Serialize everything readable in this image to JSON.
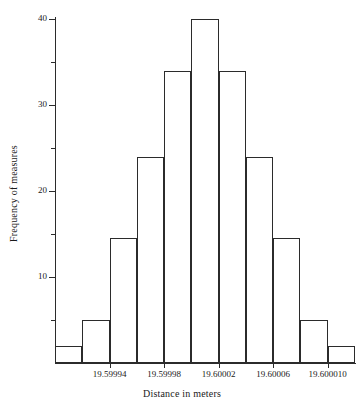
{
  "chart_data": {
    "type": "bar",
    "title": "",
    "xlabel": "Distance in meters",
    "ylabel": "Frequency of measures",
    "ylim": [
      0,
      41
    ],
    "xlim": [
      19.5999,
      19.60012
    ],
    "grid": false,
    "legend": null,
    "y_ticks_major": [
      10,
      20,
      30,
      40
    ],
    "y_tick_labels": [
      "10",
      "20",
      "30",
      "40"
    ],
    "y_ticks_minor": [
      5,
      15,
      25,
      35
    ],
    "x_tick_labels": [
      "19.59994",
      "19.59998",
      "19.60002",
      "19.60006",
      "19.600010"
    ],
    "x_tick_values": [
      19.59994,
      19.59998,
      19.60002,
      19.60006,
      19.6001
    ],
    "bin_edges": [
      19.5999,
      19.59992,
      19.59994,
      19.59996,
      19.59998,
      19.6,
      19.60002,
      19.60004,
      19.60006,
      19.60008,
      19.6001,
      19.60012
    ],
    "categories": [
      "bin1",
      "bin2",
      "bin3",
      "bin4",
      "bin5",
      "bin6",
      "bin7",
      "bin8",
      "bin9",
      "bin10",
      "bin11"
    ],
    "values": [
      2,
      5,
      14.5,
      24,
      34,
      40,
      34,
      24,
      14.5,
      5,
      2
    ],
    "bar_style": {
      "fill": "none",
      "edge_color": "#2b2b2b",
      "edge_width": 1
    }
  },
  "figure": {
    "background": "#ffffff",
    "axis_color": "#2b2b2b",
    "text_color": "#1a1a1a"
  }
}
